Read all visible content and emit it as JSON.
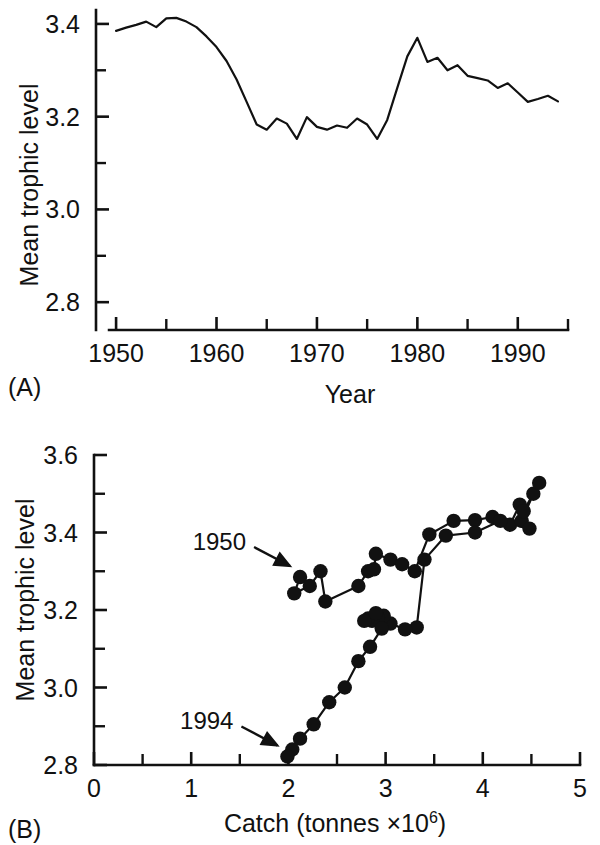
{
  "figure": {
    "panel_a_label": "(A)",
    "panel_b_label": "(B)"
  },
  "chart_data": [
    {
      "type": "line",
      "panel": "(A)",
      "title": "",
      "xlabel": "Year",
      "ylabel": "Mean trophic level",
      "xlim": [
        1948,
        1995
      ],
      "ylim": [
        2.74,
        3.43
      ],
      "grid": false,
      "legend": "none",
      "xticks": [
        1950,
        1960,
        1970,
        1980,
        1990
      ],
      "xtick_labels": [
        "1950",
        "1960",
        "1970",
        "1980",
        "1990"
      ],
      "xminor_ticks": [
        1955,
        1965,
        1975,
        1985,
        1995
      ],
      "yticks": [
        2.8,
        3.0,
        3.2,
        3.4
      ],
      "ytick_labels": [
        "2.8",
        "3.0",
        "3.2",
        "3.4"
      ],
      "yminor_ticks": [
        2.9,
        3.1,
        3.3
      ],
      "x": [
        1950,
        1951,
        1952,
        1953,
        1954,
        1955,
        1956,
        1957,
        1958,
        1959,
        1960,
        1961,
        1962,
        1963,
        1964,
        1965,
        1966,
        1967,
        1968,
        1969,
        1970,
        1971,
        1972,
        1973,
        1974,
        1975,
        1976,
        1977,
        1978,
        1979,
        1980,
        1981,
        1982,
        1983,
        1984,
        1985,
        1986,
        1987,
        1988,
        1989,
        1990,
        1991,
        1992,
        1993,
        1994
      ],
      "values": [
        3.385,
        3.392,
        3.398,
        3.405,
        3.393,
        3.412,
        3.413,
        3.405,
        3.393,
        3.373,
        3.35,
        3.32,
        3.28,
        3.232,
        3.183,
        3.172,
        3.196,
        3.185,
        3.152,
        3.199,
        3.178,
        3.172,
        3.181,
        3.176,
        3.196,
        3.183,
        3.152,
        3.193,
        3.262,
        3.33,
        3.37,
        3.318,
        3.327,
        3.3,
        3.311,
        3.288,
        3.283,
        3.278,
        3.262,
        3.272,
        3.252,
        3.232,
        3.238,
        3.245,
        3.233
      ]
    },
    {
      "type": "line",
      "panel": "(B)",
      "title": "",
      "xlabel": "Catch (tonnes ×10⁶)",
      "xlabel_base": "Catch (tonnes ×10",
      "xlabel_exponent": "6",
      "xlabel_close": ")",
      "ylabel": "Mean trophic level",
      "xlim": [
        0,
        5
      ],
      "ylim": [
        2.8,
        3.6
      ],
      "grid": false,
      "legend": "none",
      "markers": "filled-circle",
      "xticks": [
        0,
        1,
        2,
        3,
        4,
        5
      ],
      "xtick_labels": [
        "0",
        "1",
        "2",
        "3",
        "4",
        "5"
      ],
      "xminor_ticks": [
        0.5,
        1.5,
        2.5,
        3.5,
        4.5
      ],
      "yticks": [
        2.8,
        3.0,
        3.2,
        3.4,
        3.6
      ],
      "ytick_labels": [
        "2.8",
        "3.0",
        "3.2",
        "3.4",
        "3.6"
      ],
      "yminor_ticks": [
        2.9,
        3.1,
        3.3,
        3.5
      ],
      "annotations": [
        {
          "text": "1950",
          "points_to_x": 2.12,
          "points_to_y": 3.285
        },
        {
          "text": "1994",
          "points_to_x": 1.99,
          "points_to_y": 2.822
        }
      ],
      "points": [
        {
          "year": 1950,
          "x": 2.12,
          "y": 3.285
        },
        {
          "year": 1951,
          "x": 2.06,
          "y": 3.243
        },
        {
          "year": 1952,
          "x": 2.22,
          "y": 3.262
        },
        {
          "year": 1953,
          "x": 2.33,
          "y": 3.3
        },
        {
          "year": 1954,
          "x": 2.38,
          "y": 3.222
        },
        {
          "year": 1955,
          "x": 2.72,
          "y": 3.262
        },
        {
          "year": 1956,
          "x": 2.82,
          "y": 3.3
        },
        {
          "year": 1957,
          "x": 2.88,
          "y": 3.305
        },
        {
          "year": 1958,
          "x": 2.9,
          "y": 3.345
        },
        {
          "year": 1959,
          "x": 3.05,
          "y": 3.33
        },
        {
          "year": 1960,
          "x": 3.17,
          "y": 3.318
        },
        {
          "year": 1961,
          "x": 3.3,
          "y": 3.3
        },
        {
          "year": 1962,
          "x": 3.45,
          "y": 3.395
        },
        {
          "year": 1963,
          "x": 3.7,
          "y": 3.43
        },
        {
          "year": 1964,
          "x": 3.92,
          "y": 3.432
        },
        {
          "year": 1965,
          "x": 4.1,
          "y": 3.44
        },
        {
          "year": 1966,
          "x": 4.28,
          "y": 3.42
        },
        {
          "year": 1967,
          "x": 4.38,
          "y": 3.472
        },
        {
          "year": 1968,
          "x": 4.4,
          "y": 3.43
        },
        {
          "year": 1969,
          "x": 4.52,
          "y": 3.5
        },
        {
          "year": 1970,
          "x": 4.58,
          "y": 3.528
        },
        {
          "year": 1971,
          "x": 4.42,
          "y": 3.455
        },
        {
          "year": 1972,
          "x": 4.48,
          "y": 3.41
        },
        {
          "year": 1973,
          "x": 4.18,
          "y": 3.43
        },
        {
          "year": 1974,
          "x": 3.92,
          "y": 3.4
        },
        {
          "year": 1975,
          "x": 3.62,
          "y": 3.392
        },
        {
          "year": 1976,
          "x": 3.4,
          "y": 3.33
        },
        {
          "year": 1977,
          "x": 3.32,
          "y": 3.155
        },
        {
          "year": 1978,
          "x": 3.2,
          "y": 3.15
        },
        {
          "year": 1979,
          "x": 3.05,
          "y": 3.165
        },
        {
          "year": 1980,
          "x": 2.98,
          "y": 3.185
        },
        {
          "year": 1981,
          "x": 2.92,
          "y": 3.18
        },
        {
          "year": 1982,
          "x": 2.86,
          "y": 3.172
        },
        {
          "year": 1983,
          "x": 2.82,
          "y": 3.178
        },
        {
          "year": 1984,
          "x": 2.78,
          "y": 3.172
        },
        {
          "year": 1985,
          "x": 2.9,
          "y": 3.192
        },
        {
          "year": 1986,
          "x": 2.96,
          "y": 3.152
        },
        {
          "year": 1987,
          "x": 2.84,
          "y": 3.105
        },
        {
          "year": 1988,
          "x": 2.72,
          "y": 3.068
        },
        {
          "year": 1989,
          "x": 2.58,
          "y": 3.0
        },
        {
          "year": 1990,
          "x": 2.42,
          "y": 2.962
        },
        {
          "year": 1991,
          "x": 2.26,
          "y": 2.905
        },
        {
          "year": 1992,
          "x": 2.12,
          "y": 2.868
        },
        {
          "year": 1993,
          "x": 2.04,
          "y": 2.84
        },
        {
          "year": 1994,
          "x": 1.99,
          "y": 2.822
        }
      ]
    }
  ]
}
